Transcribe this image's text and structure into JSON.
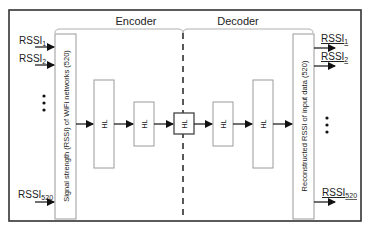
{
  "diagram": {
    "encoder_label": "Encoder",
    "decoder_label": "Decoder",
    "input_box_label": "Signal strength (RSSI) of WiFi networks (520)",
    "output_box_label": "Reconstructed RSSI of input data (520)",
    "hidden_layer_label": "HL",
    "inputs": [
      {
        "base": "RSSI",
        "sub": "1"
      },
      {
        "base": "RSSI",
        "sub": "2"
      },
      {
        "base": "RSSI",
        "sub": "520"
      }
    ],
    "outputs": [
      {
        "base": "RSSI",
        "sub": "1"
      },
      {
        "base": "RSSI",
        "sub": "2"
      },
      {
        "base": "RSSI",
        "sub": "520"
      }
    ],
    "ellipsis": "•\n•\n•",
    "colors": {
      "line": "#222222",
      "box_border": "#9a9a9a",
      "frame": "#333333"
    }
  }
}
